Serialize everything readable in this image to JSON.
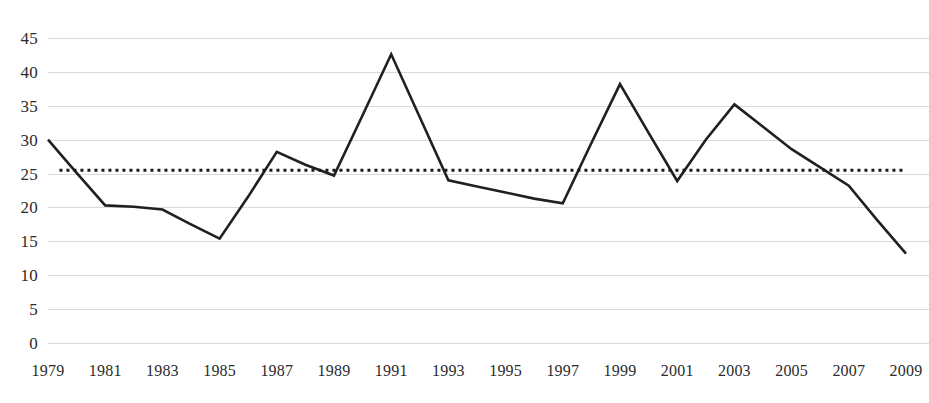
{
  "chart_data": {
    "type": "line",
    "title": "",
    "subtitle": "",
    "xlabel": "",
    "ylabel": "",
    "xlim": [
      1979,
      2009
    ],
    "ylim": [
      0,
      45
    ],
    "grid": true,
    "legend": "none",
    "y_ticks": [
      45,
      40,
      35,
      30,
      25,
      20,
      15,
      10,
      5,
      0
    ],
    "x_ticks": [
      "1979",
      "1981",
      "1983",
      "1985",
      "1987",
      "1989",
      "1991",
      "1993",
      "1995",
      "1997",
      "1999",
      "2001",
      "2003",
      "2005",
      "2007",
      "2009"
    ],
    "x": [
      1979,
      1980,
      1981,
      1982,
      1983,
      1984,
      1985,
      1986,
      1987,
      1988,
      1989,
      1990,
      1991,
      1992,
      1993,
      1994,
      1995,
      1996,
      1997,
      1998,
      1999,
      2000,
      2001,
      2002,
      2003,
      2004,
      2005,
      2006,
      2007,
      2008,
      2009
    ],
    "series": [
      {
        "name": "value",
        "color": "#231f20",
        "style": "solid",
        "values": [
          30.0,
          25.1,
          20.3,
          20.1,
          19.7,
          17.5,
          15.4,
          21.6,
          28.2,
          26.3,
          24.7,
          33.6,
          42.6,
          33.3,
          24.0,
          23.1,
          22.2,
          21.3,
          20.6,
          29.5,
          38.2,
          31.0,
          23.9,
          30.0,
          35.2,
          31.9,
          28.6,
          25.9,
          23.2,
          18.1,
          13.2
        ]
      }
    ],
    "reference_line": {
      "name": "average",
      "value": 25.5,
      "color": "#1a1a1a",
      "style": "dotted",
      "x_start": 1979.4,
      "x_end": 2009.0
    },
    "colors": {
      "series": "#231f20",
      "reference": "#1a1a1a",
      "gridline": "#d9d9d9",
      "text": "#2b2b2b",
      "background": "#ffffff"
    }
  }
}
